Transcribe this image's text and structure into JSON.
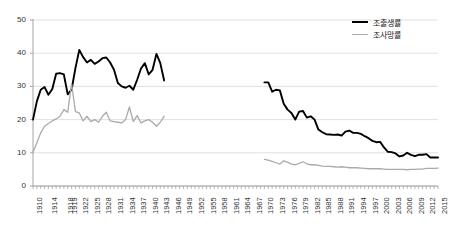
{
  "chart_data": {
    "type": "line",
    "title": "",
    "xlabel": "",
    "ylabel": "",
    "ylim": [
      0,
      50
    ],
    "yticks": [
      0,
      10,
      20,
      30,
      40,
      50
    ],
    "grid": true,
    "legend_position": "top-right",
    "xlim": [
      1910,
      2015
    ],
    "xticks": [
      1910,
      1914,
      1918,
      1919,
      1922,
      1925,
      1928,
      1931,
      1934,
      1937,
      1940,
      1943,
      1946,
      1949,
      1952,
      1955,
      1958,
      1961,
      1964,
      1967,
      1970,
      1973,
      1976,
      1979,
      1982,
      1985,
      1988,
      1991,
      1994,
      1997,
      2000,
      2003,
      2006,
      2009,
      2012,
      2015
    ],
    "series": [
      {
        "name": "조출생률",
        "color": "#000000",
        "width": 1.9,
        "segments": [
          {
            "x": [
              1910,
              1911,
              1912,
              1913,
              1914,
              1915,
              1916,
              1917,
              1918,
              1919,
              1920,
              1921,
              1922,
              1923,
              1924,
              1925,
              1926,
              1927,
              1928,
              1929,
              1930,
              1931,
              1932,
              1933,
              1934,
              1935,
              1936,
              1937,
              1938,
              1939,
              1940,
              1941,
              1942,
              1943,
              1944
            ],
            "y": [
              20.0,
              25.5,
              29.0,
              29.8,
              27.5,
              29.2,
              33.8,
              34.0,
              33.6,
              27.6,
              29.0,
              35.5,
              41.0,
              38.8,
              37.2,
              38.0,
              36.8,
              37.5,
              38.5,
              38.7,
              37.2,
              35.0,
              31.0,
              30.0,
              29.6,
              30.2,
              29.0,
              32.0,
              35.4,
              37.0,
              33.6,
              35.0,
              39.8,
              37.0,
              31.8
            ]
          },
          {
            "x": [
              1970,
              1971,
              1972,
              1973,
              1974,
              1975,
              1976,
              1977,
              1978,
              1979,
              1980,
              1981,
              1982,
              1983,
              1984,
              1985,
              1986,
              1987,
              1988,
              1989,
              1990,
              1991,
              1992,
              1993,
              1994,
              1995,
              1996,
              1997,
              1998,
              1999,
              2000,
              2001,
              2002,
              2003,
              2004,
              2005,
              2006,
              2007,
              2008,
              2009,
              2010,
              2011,
              2012,
              2013,
              2014,
              2015
            ],
            "y": [
              31.2,
              31.2,
              28.4,
              29.0,
              28.8,
              24.8,
              23.0,
              22.0,
              20.0,
              22.4,
              22.6,
              20.6,
              21.0,
              20.0,
              17.0,
              16.2,
              15.6,
              15.5,
              15.4,
              15.5,
              15.2,
              16.4,
              16.7,
              16.0,
              16.0,
              15.7,
              15.0,
              14.4,
              13.6,
              13.2,
              13.3,
              11.6,
              10.3,
              10.2,
              9.8,
              8.9,
              9.2,
              10.0,
              9.4,
              9.0,
              9.4,
              9.4,
              9.6,
              8.6,
              8.6,
              8.6
            ]
          }
        ]
      },
      {
        "name": "조사망률",
        "color": "#aaaaaa",
        "width": 1.3,
        "segments": [
          {
            "x": [
              1910,
              1911,
              1912,
              1913,
              1914,
              1915,
              1916,
              1917,
              1918,
              1919,
              1920,
              1921,
              1922,
              1923,
              1924,
              1925,
              1926,
              1927,
              1928,
              1929,
              1930,
              1931,
              1932,
              1933,
              1934,
              1935,
              1936,
              1937,
              1938,
              1939,
              1940,
              1941,
              1942,
              1943,
              1944
            ],
            "y": [
              10.2,
              13.0,
              16.0,
              18.0,
              18.8,
              19.6,
              20.2,
              21.0,
              23.0,
              22.2,
              30.8,
              22.4,
              22.0,
              19.6,
              21.0,
              19.4,
              20.0,
              19.2,
              21.0,
              22.2,
              19.6,
              19.4,
              19.2,
              19.0,
              20.0,
              23.8,
              19.4,
              21.2,
              19.0,
              19.6,
              20.0,
              19.2,
              18.0,
              19.2,
              21.0
            ]
          },
          {
            "x": [
              1970,
              1971,
              1972,
              1973,
              1974,
              1975,
              1976,
              1977,
              1978,
              1979,
              1980,
              1981,
              1982,
              1983,
              1984,
              1985,
              1986,
              1987,
              1988,
              1989,
              1990,
              1991,
              1992,
              1993,
              1994,
              1995,
              1996,
              1997,
              1998,
              1999,
              2000,
              2001,
              2002,
              2003,
              2004,
              2005,
              2006,
              2007,
              2008,
              2009,
              2010,
              2011,
              2012,
              2013,
              2014,
              2015
            ],
            "y": [
              8.0,
              7.8,
              7.4,
              7.0,
              6.6,
              7.6,
              7.2,
              6.6,
              6.4,
              6.8,
              7.3,
              6.7,
              6.4,
              6.4,
              6.2,
              6.0,
              5.9,
              5.9,
              5.8,
              5.7,
              5.8,
              5.7,
              5.5,
              5.5,
              5.5,
              5.4,
              5.3,
              5.2,
              5.2,
              5.2,
              5.2,
              5.1,
              5.0,
              5.0,
              5.0,
              5.0,
              5.0,
              4.9,
              5.0,
              5.0,
              5.1,
              5.1,
              5.3,
              5.3,
              5.3,
              5.4
            ]
          }
        ]
      }
    ]
  },
  "legend": {
    "entries": [
      {
        "label": "조출생률"
      },
      {
        "label": "조사망률"
      }
    ]
  },
  "axis": {
    "y_labels": [
      "0",
      "10",
      "20",
      "30",
      "40",
      "50"
    ]
  }
}
